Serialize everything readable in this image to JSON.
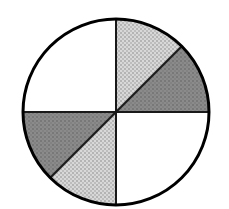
{
  "figure": {
    "name": "fraction-circle",
    "title": "Shaded fraction circle",
    "background_color": "#ffffff",
    "outline_color": "#000000",
    "outline_width": 3,
    "divider_color": "#1a1a1a",
    "divider_width": 2,
    "sector_edge_color": "#1a1a1a",
    "sector_edge_width": 2,
    "center_x": 116,
    "center_y": 112,
    "radius": 93,
    "total_sectors": 6,
    "shaded_sectors": 4,
    "shaded_degrees": 180,
    "total_degrees": 360,
    "fraction_shaded": "1/2",
    "fills": {
      "white": "#ffffff",
      "light_gray": "#c9c9c9",
      "dark_gray": "#848484"
    },
    "dividers": [
      {
        "name": "vertical-diameter",
        "x1": 116,
        "y1": 19,
        "x2": 116,
        "y2": 205
      },
      {
        "name": "horizontal-diameter",
        "x1": 23,
        "y1": 112,
        "x2": 209,
        "y2": 112
      }
    ],
    "sectors": [
      {
        "id": "sector-top-left",
        "label": "Top-left quadrant",
        "start_deg": 180,
        "end_deg": 270,
        "span_deg": 90,
        "fill": "white",
        "shaded": false,
        "pattern": "none"
      },
      {
        "id": "sector-top-right-upper",
        "label": "Top-right upper eighth",
        "start_deg": 270,
        "end_deg": 315,
        "span_deg": 45,
        "fill": "light_gray",
        "shaded": true,
        "pattern": "stipple"
      },
      {
        "id": "sector-top-right-lower",
        "label": "Top-right lower eighth",
        "start_deg": 315,
        "end_deg": 360,
        "span_deg": 45,
        "fill": "dark_gray",
        "shaded": true,
        "pattern": "stipple"
      },
      {
        "id": "sector-bottom-right",
        "label": "Bottom-right quadrant",
        "start_deg": 0,
        "end_deg": 90,
        "span_deg": 90,
        "fill": "white",
        "shaded": false,
        "pattern": "none"
      },
      {
        "id": "sector-bottom-left-lower",
        "label": "Bottom-left lower eighth",
        "start_deg": 90,
        "end_deg": 135,
        "span_deg": 45,
        "fill": "light_gray",
        "shaded": true,
        "pattern": "stipple"
      },
      {
        "id": "sector-bottom-left-upper",
        "label": "Bottom-left upper eighth",
        "start_deg": 135,
        "end_deg": 180,
        "span_deg": 45,
        "fill": "dark_gray",
        "shaded": true,
        "pattern": "stipple"
      }
    ]
  }
}
